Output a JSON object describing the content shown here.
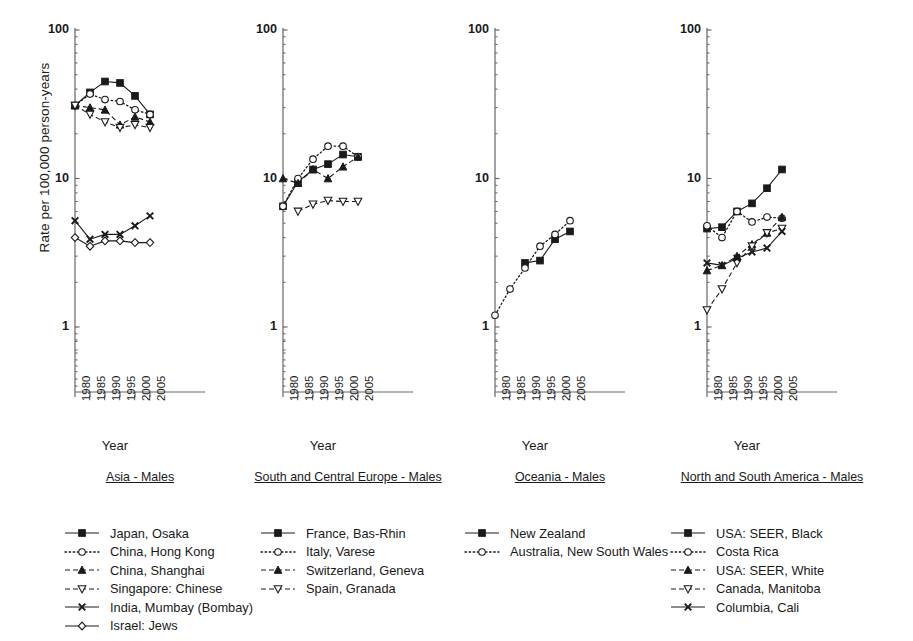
{
  "figure": {
    "y_axis_title": "Rate per 100,000 person-years",
    "x_axis_title": "Year",
    "y_ticks": [
      "100",
      "10",
      "1"
    ],
    "y_tick_values": [
      100,
      10,
      1
    ],
    "x_ticks": [
      "1980",
      "1985",
      "1990",
      "1995",
      "2000",
      "2005"
    ],
    "x_tick_values": [
      1980,
      1985,
      1990,
      1995,
      2000,
      2005
    ],
    "axis_color": "#666666",
    "line_color": "#1a1a1a"
  },
  "chart_data": [
    {
      "type": "line",
      "title": "Asia - Males",
      "xlabel": "Year",
      "ylabel": "Rate per 100,000 person-years",
      "yscale": "log",
      "ylim": [
        1,
        100
      ],
      "xlim": [
        1978,
        2008
      ],
      "grid": false,
      "legend": "below",
      "x": [
        1980,
        1985,
        1990,
        1995,
        2000,
        2005
      ],
      "series": [
        {
          "name": "Japan, Osaka",
          "marker": "filled-square",
          "line": "solid",
          "x": [
            1980,
            1985,
            1990,
            1995,
            2000,
            2005
          ],
          "values": [
            31,
            38,
            45,
            44,
            36,
            27
          ]
        },
        {
          "name": "China, Hong Kong",
          "marker": "open-circle",
          "line": "dotted",
          "x": [
            1980,
            1985,
            1990,
            1995,
            2000,
            2005
          ],
          "values": [
            31,
            37,
            34,
            33,
            29,
            27
          ]
        },
        {
          "name": "China, Shanghai",
          "marker": "filled-triangle",
          "line": "dashed",
          "x": [
            1980,
            1985,
            1990,
            1995,
            2000,
            2005
          ],
          "values": [
            31,
            30,
            29,
            23,
            26,
            24
          ]
        },
        {
          "name": "Singapore: Chinese",
          "marker": "open-down-triangle",
          "line": "dashed",
          "x": [
            1980,
            1985,
            1990,
            1995,
            2000,
            2005
          ],
          "values": [
            31,
            27,
            24,
            22,
            23,
            22
          ]
        },
        {
          "name": "India, Mumbay (Bombay)",
          "marker": "cross",
          "line": "solid",
          "x": [
            1980,
            1985,
            1990,
            1995,
            2000,
            2005
          ],
          "values": [
            5.2,
            3.9,
            4.2,
            4.2,
            4.8,
            5.6
          ]
        },
        {
          "name": "Israel: Jews",
          "marker": "open-diamond",
          "line": "solid",
          "x": [
            1980,
            1985,
            1990,
            1995,
            2000,
            2005
          ],
          "values": [
            4.0,
            3.5,
            3.8,
            3.8,
            3.7,
            3.7
          ]
        }
      ]
    },
    {
      "type": "line",
      "title": "South and Central Europe - Males",
      "xlabel": "Year",
      "ylabel": "Rate per 100,000 person-years",
      "yscale": "log",
      "ylim": [
        1,
        100
      ],
      "xlim": [
        1978,
        2008
      ],
      "grid": false,
      "legend": "below",
      "x": [
        1980,
        1985,
        1990,
        1995,
        2000,
        2005
      ],
      "series": [
        {
          "name": "France, Bas-Rhin",
          "marker": "filled-square",
          "line": "solid",
          "x": [
            1980,
            1985,
            1990,
            1995,
            2000,
            2005
          ],
          "values": [
            6.5,
            9.5,
            11.5,
            12.5,
            14.5,
            14.0
          ]
        },
        {
          "name": "Italy, Varese",
          "marker": "open-circle",
          "line": "dotted",
          "x": [
            1980,
            1985,
            1990,
            1995,
            2000,
            2005
          ],
          "values": [
            6.5,
            10.0,
            13.5,
            16.5,
            16.5,
            14.0
          ]
        },
        {
          "name": "Switzerland, Geneva",
          "marker": "filled-triangle",
          "line": "dashed",
          "x": [
            1980,
            1985,
            1990,
            1995,
            2000,
            2005
          ],
          "values": [
            10.0,
            9.3,
            11.5,
            10.0,
            12.0,
            14.0
          ]
        },
        {
          "name": "Spain, Granada",
          "marker": "open-down-triangle",
          "line": "dashed",
          "x": [
            1985,
            1990,
            1995,
            2000,
            2005
          ],
          "values": [
            6.0,
            6.7,
            7.1,
            7.0,
            7.0
          ]
        }
      ]
    },
    {
      "type": "line",
      "title": "Oceania - Males",
      "xlabel": "Year",
      "ylabel": "Rate per 100,000 person-years",
      "yscale": "log",
      "ylim": [
        1,
        100
      ],
      "xlim": [
        1978,
        2008
      ],
      "grid": false,
      "legend": "below",
      "x": [
        1980,
        1985,
        1990,
        1995,
        2000,
        2005
      ],
      "series": [
        {
          "name": "New Zealand",
          "marker": "filled-square",
          "line": "solid",
          "x": [
            1990,
            1995,
            2000,
            2005
          ],
          "values": [
            2.7,
            2.8,
            3.9,
            4.4
          ]
        },
        {
          "name": "Australia, New South Wales",
          "marker": "open-circle",
          "line": "dotted",
          "x": [
            1980,
            1985,
            1990,
            1995,
            2000,
            2005
          ],
          "values": [
            1.2,
            1.8,
            2.5,
            3.5,
            4.2,
            5.2
          ]
        }
      ]
    },
    {
      "type": "line",
      "title": "North and South America - Males",
      "xlabel": "Year",
      "ylabel": "Rate per 100,000 person-years",
      "yscale": "log",
      "ylim": [
        1,
        100
      ],
      "xlim": [
        1978,
        2008
      ],
      "grid": false,
      "legend": "below",
      "x": [
        1980,
        1985,
        1990,
        1995,
        2000,
        2005
      ],
      "series": [
        {
          "name": "USA: SEER, Black",
          "marker": "filled-square",
          "line": "solid",
          "x": [
            1980,
            1985,
            1990,
            1995,
            2000,
            2005
          ],
          "values": [
            4.6,
            4.7,
            6.0,
            6.8,
            8.6,
            11.5
          ]
        },
        {
          "name": "Costa Rica",
          "marker": "open-circle",
          "line": "dotted",
          "x": [
            1980,
            1985,
            1990,
            1995,
            2000,
            2005
          ],
          "values": [
            4.8,
            4.0,
            6.0,
            5.1,
            5.5,
            5.4
          ]
        },
        {
          "name": "USA: SEER, White",
          "marker": "filled-triangle",
          "line": "dashed",
          "x": [
            1980,
            1985,
            1990,
            1995,
            2000,
            2005
          ],
          "values": [
            2.4,
            2.6,
            3.0,
            3.6,
            4.3,
            5.5
          ]
        },
        {
          "name": "Canada, Manitoba",
          "marker": "open-down-triangle",
          "line": "dashed",
          "x": [
            1980,
            1985,
            1990,
            1995,
            2000,
            2005
          ],
          "values": [
            1.3,
            1.8,
            2.7,
            3.5,
            4.3,
            4.6
          ]
        },
        {
          "name": "Columbia, Cali",
          "marker": "cross",
          "line": "solid",
          "x": [
            1980,
            1985,
            1990,
            1995,
            2000,
            2005
          ],
          "values": [
            2.7,
            2.6,
            2.9,
            3.2,
            3.4,
            4.4
          ]
        }
      ]
    }
  ],
  "panels": [
    {
      "caption": "Asia - Males"
    },
    {
      "caption": "South and Central Europe - Males"
    },
    {
      "caption": "Oceania - Males"
    },
    {
      "caption": "North and South America - Males"
    }
  ],
  "legend_columns": [
    {
      "items": [
        {
          "label": "Japan, Osaka",
          "marker": "filled-square",
          "line": "solid"
        },
        {
          "label": "China, Hong Kong",
          "marker": "open-circle",
          "line": "dotted"
        },
        {
          "label": "China, Shanghai",
          "marker": "filled-triangle",
          "line": "dashed"
        },
        {
          "label": "Singapore: Chinese",
          "marker": "open-down-triangle",
          "line": "dashed"
        },
        {
          "label": "India, Mumbay (Bombay)",
          "marker": "cross",
          "line": "solid"
        },
        {
          "label": "Israel: Jews",
          "marker": "open-diamond",
          "line": "solid"
        }
      ]
    },
    {
      "items": [
        {
          "label": "France, Bas-Rhin",
          "marker": "filled-square",
          "line": "solid"
        },
        {
          "label": "Italy, Varese",
          "marker": "open-circle",
          "line": "dotted"
        },
        {
          "label": "Switzerland, Geneva",
          "marker": "filled-triangle",
          "line": "dashed"
        },
        {
          "label": "Spain, Granada",
          "marker": "open-down-triangle",
          "line": "dashed"
        }
      ]
    },
    {
      "items": [
        {
          "label": "New Zealand",
          "marker": "filled-square",
          "line": "solid"
        },
        {
          "label": "Australia, New South Wales",
          "marker": "open-circle",
          "line": "dotted"
        }
      ]
    },
    {
      "items": [
        {
          "label": "USA: SEER, Black",
          "marker": "filled-square",
          "line": "solid"
        },
        {
          "label": "Costa Rica",
          "marker": "open-circle",
          "line": "dotted"
        },
        {
          "label": "USA: SEER, White",
          "marker": "filled-triangle",
          "line": "dashed"
        },
        {
          "label": "Canada, Manitoba",
          "marker": "open-down-triangle",
          "line": "dashed"
        },
        {
          "label": "Columbia, Cali",
          "marker": "cross",
          "line": "solid"
        }
      ]
    }
  ]
}
